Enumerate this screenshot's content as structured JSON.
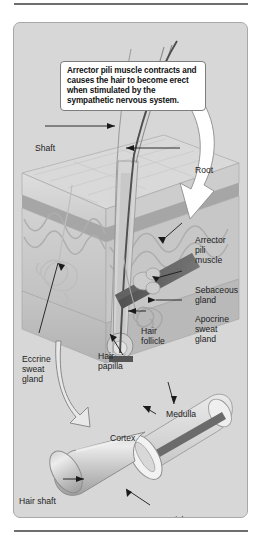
{
  "figure": {
    "callout": {
      "text": "Arrector pili muscle contracts and causes the hair to become erect when stimulated by the sympathetic nervous system."
    },
    "skin_diagram": {
      "labels": [
        {
          "id": "shaft",
          "text": "Shaft"
        },
        {
          "id": "root",
          "text": "Root"
        },
        {
          "id": "arrector",
          "text": "Arrector\npili\nmuscle"
        },
        {
          "id": "sebaceous",
          "text": "Sebaceous\ngland"
        },
        {
          "id": "apocrine",
          "text": "Apocrine\nsweat\ngland"
        },
        {
          "id": "follicle",
          "text": "Hair\nfollicle"
        },
        {
          "id": "papilla",
          "text": "Hair\npapilla"
        },
        {
          "id": "eccrine",
          "text": "Eccrine\nsweat\ngland"
        }
      ]
    },
    "shaft_inset": {
      "labels": [
        {
          "id": "medulla",
          "text": "Medulla"
        },
        {
          "id": "cortex",
          "text": "Cortex"
        },
        {
          "id": "hair_shaft",
          "text": "Hair shaft"
        },
        {
          "id": "cuticle",
          "text": "Cuticle"
        }
      ]
    },
    "colors": {
      "page_background": "#ffffff",
      "panel_background": "#d7d7d7",
      "panel_border": "#a8a8a8",
      "rule": "#6e6e6e",
      "callout_background": "#ffffff",
      "callout_border": "#7d7d7d",
      "label_text": "#1d1d1d",
      "leader_line": "#1a1a1a",
      "epidermis": "#cfcfcf",
      "dermis": "#c2c2c2",
      "hypodermis": "#b6b6b6",
      "muscle_dark": "#5a5a5a",
      "medulla_rod": "#6b6b6b",
      "cylinder_light": "#e2e2e2",
      "cylinder_mid": "#b9b9b9",
      "callout_tail": "#ffffff"
    }
  }
}
